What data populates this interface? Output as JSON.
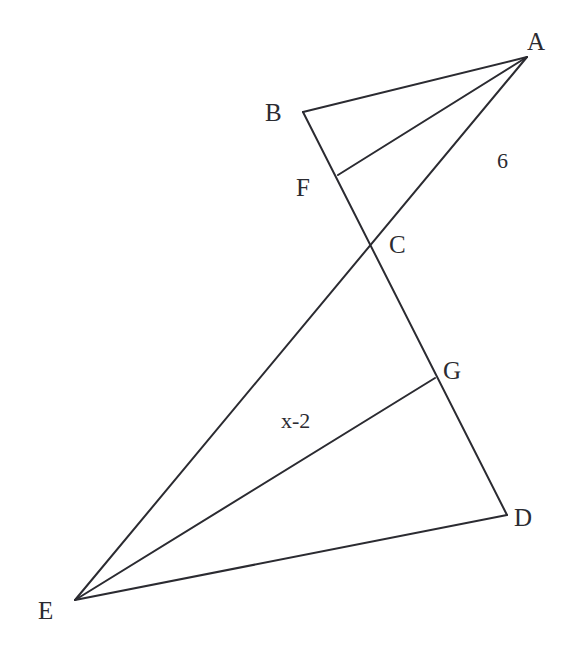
{
  "figure": {
    "background_color": "#ffffff",
    "stroke_color": "#2b2b31",
    "width": 572,
    "height": 655
  },
  "points": {
    "A": {
      "label": "A",
      "x": 527,
      "y": 57
    },
    "B": {
      "label": "B",
      "x": 303,
      "y": 112
    },
    "C": {
      "label": "C",
      "x": 372,
      "y": 245
    },
    "D": {
      "label": "D",
      "x": 507,
      "y": 515
    },
    "E": {
      "label": "E",
      "x": 75,
      "y": 600
    },
    "F": {
      "label": "F",
      "x": 338,
      "y": 175
    },
    "G": {
      "label": "G",
      "x": 435,
      "y": 378
    }
  },
  "segments": [
    {
      "name": "segment-AB",
      "from": "A",
      "to": "B",
      "path": "M 527 57 L 303 112"
    },
    {
      "name": "segment-AF",
      "from": "A",
      "to": "F",
      "path": "M 527 57 L 338 175"
    },
    {
      "name": "segment-AE-through-C",
      "from": "A",
      "to": "E",
      "path": "M 527 57 L 75 600"
    },
    {
      "name": "segment-BD-through-F-C-G",
      "from": "B",
      "to": "D",
      "path": "M 303 112 L 507 515"
    },
    {
      "name": "segment-EG",
      "from": "E",
      "to": "G",
      "path": "M 75 600 L 435 378"
    },
    {
      "name": "segment-ED",
      "from": "E",
      "to": "D",
      "path": "M 75 600 L 507 515"
    }
  ],
  "measures": {
    "side_AC": "6",
    "side_EG": "x-2"
  }
}
